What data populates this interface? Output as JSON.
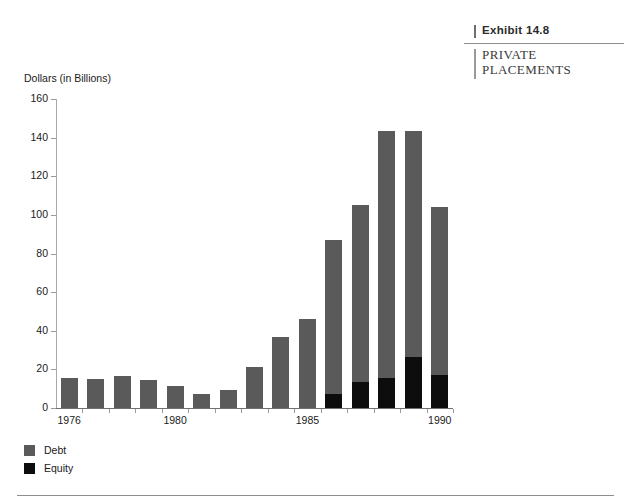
{
  "exhibit": {
    "number_label": "Exhibit 14.8",
    "number_small_caps": "XHIBIT",
    "subtitle_line1": "PRIVATE",
    "subtitle_line2": "PLACEMENTS"
  },
  "legend": {
    "items": [
      {
        "label": "Debt",
        "color": "#5a5a5a"
      },
      {
        "label": "Equity",
        "color": "#0d0d0d"
      }
    ]
  },
  "colors": {
    "debt": "#5a5a5a",
    "equity": "#0d0d0d",
    "axis": "#6f6f6f",
    "rule": "#8e8e8e"
  },
  "chart_data": {
    "type": "bar",
    "subtype": "stacked-vertical",
    "title": "Exhibit 14.8 Private Placements",
    "xlabel": "",
    "ylabel": "Dollars (in Billions)",
    "ylim": [
      0,
      160
    ],
    "ytick_step": 20,
    "yticks": [
      160,
      140,
      120,
      100,
      80,
      60,
      40,
      20,
      0
    ],
    "grid": false,
    "legend_position": "below-left",
    "categories": [
      "1976",
      "1977",
      "1978",
      "1979",
      "1980",
      "1981",
      "1982",
      "1983",
      "1984",
      "1985",
      "1986",
      "1987",
      "1988",
      "1989",
      "1990"
    ],
    "xtick_labels_shown": [
      "1976",
      "1980",
      "1985",
      "1990"
    ],
    "series": [
      {
        "name": "Debt",
        "color": "#5a5a5a",
        "values": [
          15.5,
          15.0,
          16.5,
          14.5,
          11.5,
          7.0,
          9.5,
          21.0,
          37.0,
          46.0,
          80.0,
          91.5,
          128.0,
          117.0,
          87.0
        ]
      },
      {
        "name": "Equity",
        "color": "#0d0d0d",
        "values": [
          0,
          0,
          0,
          0,
          0,
          0,
          0,
          0,
          0,
          0,
          7.0,
          13.5,
          15.5,
          26.5,
          17.0
        ]
      }
    ],
    "totals": [
      15.5,
      15.0,
      16.5,
      14.5,
      11.5,
      7.0,
      9.5,
      21.0,
      37.0,
      46.0,
      87.0,
      105.0,
      143.5,
      143.5,
      104.0
    ]
  }
}
